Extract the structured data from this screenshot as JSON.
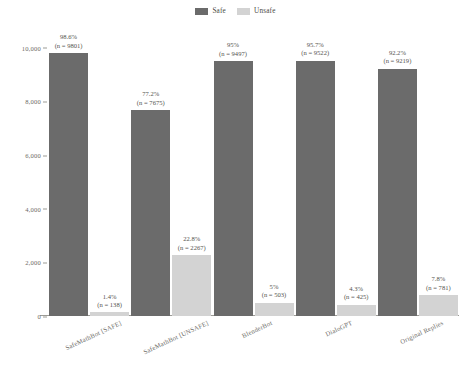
{
  "chart_data": {
    "type": "bar",
    "title": "",
    "subtitle": "",
    "xlabel": "",
    "ylabel": "",
    "ylim": [
      0,
      10400
    ],
    "grid": false,
    "legend_position": "top-center",
    "yticks": [
      "0",
      "2,000",
      "4,000",
      "6,000",
      "8,000",
      "10,000"
    ],
    "ytick_values": [
      0,
      2000,
      4000,
      6000,
      8000,
      10000
    ],
    "categories": [
      "SafeMathBot [SAFE]",
      "SafeMathBot [UNSAFE]",
      "BlenderBot",
      "DialoGPT",
      "Original Replies"
    ],
    "series": [
      {
        "name": "Safe",
        "color": "#6b6b6b",
        "values": [
          9801,
          7675,
          9497,
          9522,
          9219
        ],
        "percent_labels": [
          "98.6%",
          "77.2%",
          "95%",
          "95.7%",
          "92.2%"
        ],
        "count_labels": [
          "(n = 9801)",
          "(n = 7675)",
          "(n = 9497)",
          "(n = 9522)",
          "(n = 9219)"
        ]
      },
      {
        "name": "Unsafe",
        "color": "#d3d3d3",
        "values": [
          138,
          2267,
          503,
          425,
          781
        ],
        "percent_labels": [
          "1.4%",
          "22.8%",
          "5%",
          "4.3%",
          "7.8%"
        ],
        "count_labels": [
          "(n = 138)",
          "(n = 2267)",
          "(n = 503)",
          "(n = 425)",
          "(n = 781)"
        ]
      }
    ]
  },
  "legend": {
    "items": [
      {
        "label": "Safe",
        "color": "#6b6b6b"
      },
      {
        "label": "Unsafe",
        "color": "#d3d3d3"
      }
    ]
  },
  "colors": {
    "safe": "#6b6b6b",
    "unsafe": "#d3d3d3",
    "axis": "#9c9b96",
    "text": "#55544f"
  }
}
